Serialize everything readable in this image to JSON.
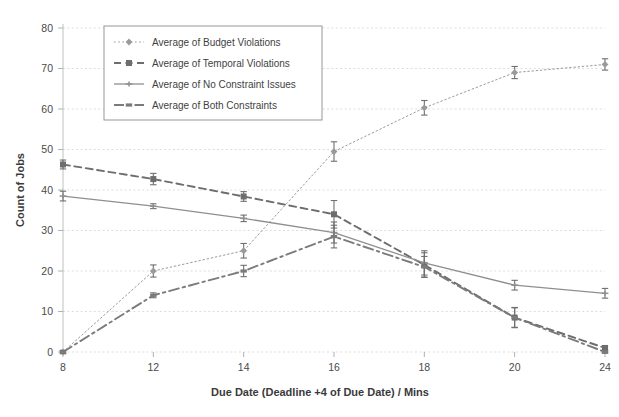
{
  "chart_data": {
    "type": "line",
    "title": "",
    "xlabel": "Due Date (Deadline +4 of Due Date)  /  Mins",
    "ylabel": "Count of Jobs",
    "categories": [
      "8",
      "12",
      "14",
      "16",
      "18",
      "20",
      "24"
    ],
    "x": [
      8,
      12,
      14,
      16,
      18,
      20,
      24
    ],
    "ylim": [
      0,
      80
    ],
    "yticks": [
      0,
      10,
      20,
      30,
      40,
      50,
      60,
      70,
      80
    ],
    "grid": true,
    "legend_position": "top-left",
    "error_bars": true,
    "series": [
      {
        "name": "Average of Budget Violations",
        "marker": "diamond",
        "linestyle": "dotted",
        "color": "#9a9a9a",
        "values": [
          0,
          20,
          25,
          49.5,
          60.3,
          69,
          71
        ],
        "errors": [
          0.4,
          1.5,
          1.8,
          2.4,
          1.8,
          1.5,
          1.4
        ]
      },
      {
        "name": "Average of Temporal Violations",
        "marker": "square",
        "linestyle": "dashed",
        "color": "#6d6d6d",
        "values": [
          46.3,
          42.7,
          38.4,
          34,
          21.5,
          8.5,
          1
        ],
        "errors": [
          1.1,
          1.4,
          1.2,
          3.4,
          3.0,
          2.5,
          0.4
        ]
      },
      {
        "name": "Average of No Constraint Issues",
        "marker": "star",
        "linestyle": "solid",
        "color": "#8f8f8f",
        "values": [
          38.5,
          36,
          33,
          29.5,
          22,
          16.5,
          14.5
        ],
        "errors": [
          1.2,
          0.6,
          0.8,
          2.6,
          3.0,
          1.2,
          1.2
        ]
      },
      {
        "name": "Average of Both Constraints",
        "marker": "dash",
        "linestyle": "dashdot",
        "color": "#7b7b7b",
        "values": [
          0,
          14,
          20,
          28.5,
          21,
          8.5,
          0
        ],
        "errors": [
          0.4,
          0.6,
          1.4,
          2.8,
          2.6,
          2.4,
          0.3
        ]
      }
    ]
  },
  "legend": {
    "items": [
      {
        "label": "Average of Budget Violations"
      },
      {
        "label": "Average of Temporal Violations"
      },
      {
        "label": "Average of No Constraint Issues"
      },
      {
        "label": "Average of Both Constraints"
      }
    ]
  },
  "axes": {
    "y_label": "Count of Jobs",
    "x_label": "Due Date (Deadline +4 of Due Date)  /  Mins",
    "y_ticks": [
      "0",
      "10",
      "20",
      "30",
      "40",
      "50",
      "60",
      "70",
      "80"
    ],
    "x_ticks": [
      "8",
      "12",
      "14",
      "16",
      "18",
      "20",
      "24"
    ]
  }
}
